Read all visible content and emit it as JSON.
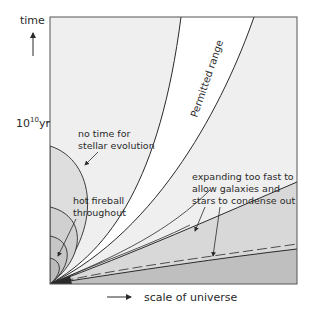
{
  "axes": {
    "y_label": "time",
    "y_tick_label_base": "10",
    "y_tick_label_exp": "10",
    "y_tick_label_unit": "yr",
    "x_label": "scale of universe"
  },
  "regions": {
    "permitted": "Permitted range",
    "no_time_line1": "no time for",
    "no_time_line2": "stellar evolution",
    "hot_fireball_line1": "hot fireball",
    "hot_fireball_line2": "throughout",
    "expanding_line1": "expanding too fast to",
    "expanding_line2": "allow galaxies and",
    "expanding_line3": "stars to condense out"
  },
  "colors": {
    "background_light": "#efefef",
    "permitted_fill": "#ffffff",
    "gray_mid": "#d6d6d6",
    "gray_dark": "#bdbdbd",
    "circle_fill_1": "#dcdcdc",
    "circle_fill_2": "#cfcfcf",
    "circle_fill_3": "#c4c4c4",
    "line": "#2a2a2a"
  }
}
